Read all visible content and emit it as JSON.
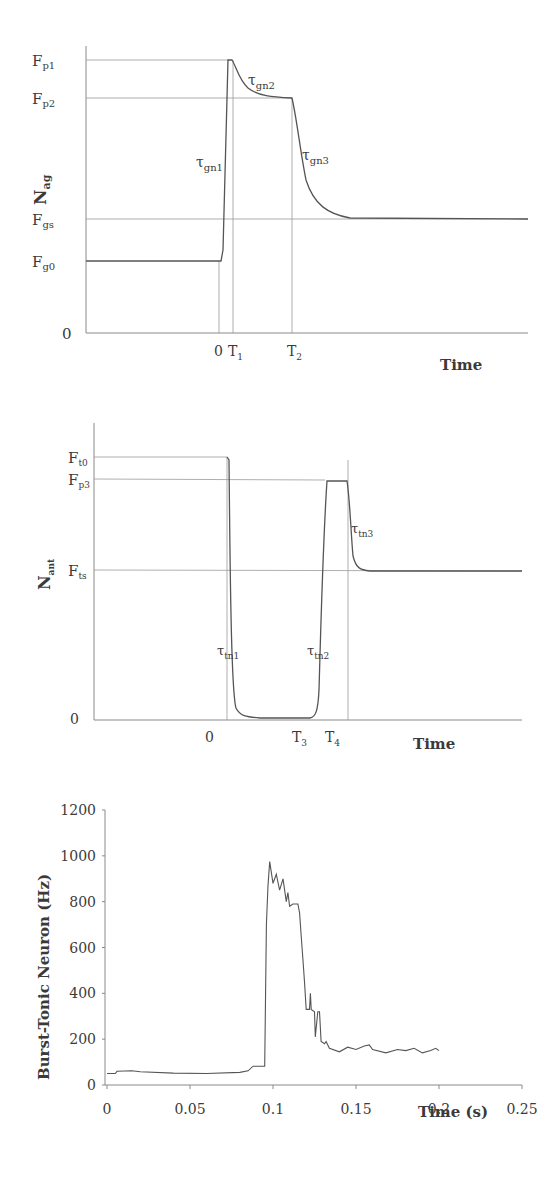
{
  "chart_data": [
    {
      "type": "line",
      "title": "",
      "xlabel": "Time",
      "ylabel": "N_ag",
      "ylabel_main": "N",
      "ylabel_sub": "ag",
      "schematic": true,
      "y_levels": [
        {
          "name": "F_p1",
          "main": "F",
          "sub": "p1"
        },
        {
          "name": "F_p2",
          "main": "F",
          "sub": "p2"
        },
        {
          "name": "F_gs",
          "main": "F",
          "sub": "gs"
        },
        {
          "name": "F_g0",
          "main": "F",
          "sub": "g0"
        },
        {
          "name": "0",
          "main": "0",
          "sub": ""
        }
      ],
      "x_markers": [
        {
          "name": "0",
          "main": "0",
          "sub": ""
        },
        {
          "name": "T_1",
          "main": "T",
          "sub": "1"
        },
        {
          "name": "T_2",
          "main": "T",
          "sub": "2"
        }
      ],
      "annotations": [
        {
          "name": "tau_gn1",
          "main": "τ",
          "sub": "gn1"
        },
        {
          "name": "tau_gn2",
          "main": "τ",
          "sub": "gn2"
        },
        {
          "name": "tau_gn3",
          "main": "τ",
          "sub": "gn3"
        }
      ],
      "description": "Agonist neural input: steady at F_g0, rises rapidly (tau_gn1) at time 0 to F_p1 by T_1, decays (tau_gn2) to F_p2, holds until T_2, then decays (tau_gn3) to steady F_gs."
    },
    {
      "type": "line",
      "title": "",
      "xlabel": "Time",
      "ylabel": "N_ant",
      "ylabel_main": "N",
      "ylabel_sub": "ant",
      "schematic": true,
      "y_levels": [
        {
          "name": "F_t0",
          "main": "F",
          "sub": "t0"
        },
        {
          "name": "F_p3",
          "main": "F",
          "sub": "p3"
        },
        {
          "name": "F_ts",
          "main": "F",
          "sub": "ts"
        },
        {
          "name": "0",
          "main": "0",
          "sub": ""
        }
      ],
      "x_markers": [
        {
          "name": "0",
          "main": "0",
          "sub": ""
        },
        {
          "name": "T_3",
          "main": "T",
          "sub": "3"
        },
        {
          "name": "T_4",
          "main": "T",
          "sub": "4"
        }
      ],
      "annotations": [
        {
          "name": "tau_tn1",
          "main": "τ",
          "sub": "tn1"
        },
        {
          "name": "tau_tn2",
          "main": "τ",
          "sub": "tn2"
        },
        {
          "name": "tau_tn3",
          "main": "τ",
          "sub": "tn3"
        }
      ],
      "description": "Antagonist neural input: steady at F_t0, drops (tau_tn1) at time 0 to ~0, stays near 0 until T_3, rises (tau_tn2) to F_p3, holds until T_4, then decays (tau_tn3) to steady F_ts."
    },
    {
      "type": "line",
      "title": "",
      "xlabel": "Time (s)",
      "ylabel": "Burst-Tonic Neuron (Hz)",
      "xlim": [
        0,
        0.25
      ],
      "ylim": [
        0,
        1200
      ],
      "x_ticks": [
        "0",
        "0.05",
        "0.1",
        "0.15",
        "0.2",
        "0.25"
      ],
      "y_ticks": [
        "0",
        "200",
        "400",
        "600",
        "800",
        "1000",
        "1200"
      ],
      "grid": false,
      "series": [
        {
          "name": "Burst-Tonic Neuron",
          "x": [
            0,
            0.005,
            0.006,
            0.015,
            0.02,
            0.04,
            0.06,
            0.08,
            0.085,
            0.088,
            0.095,
            0.096,
            0.097,
            0.098,
            0.1,
            0.102,
            0.104,
            0.106,
            0.108,
            0.109,
            0.11,
            0.112,
            0.115,
            0.116,
            0.117,
            0.118,
            0.119,
            0.12,
            0.122,
            0.1225,
            0.123,
            0.125,
            0.1255,
            0.127,
            0.128,
            0.129,
            0.131,
            0.132,
            0.134,
            0.14,
            0.145,
            0.15,
            0.155,
            0.158,
            0.16,
            0.168,
            0.175,
            0.18,
            0.185,
            0.19,
            0.195,
            0.198,
            0.2
          ],
          "values": [
            50,
            50,
            60,
            62,
            58,
            52,
            50,
            55,
            62,
            82,
            82,
            700,
            870,
            975,
            880,
            920,
            850,
            900,
            800,
            840,
            780,
            790,
            790,
            750,
            650,
            550,
            450,
            330,
            330,
            400,
            330,
            320,
            210,
            320,
            320,
            190,
            180,
            190,
            160,
            145,
            165,
            155,
            170,
            175,
            155,
            140,
            155,
            150,
            160,
            140,
            150,
            160,
            150
          ]
        }
      ]
    }
  ]
}
